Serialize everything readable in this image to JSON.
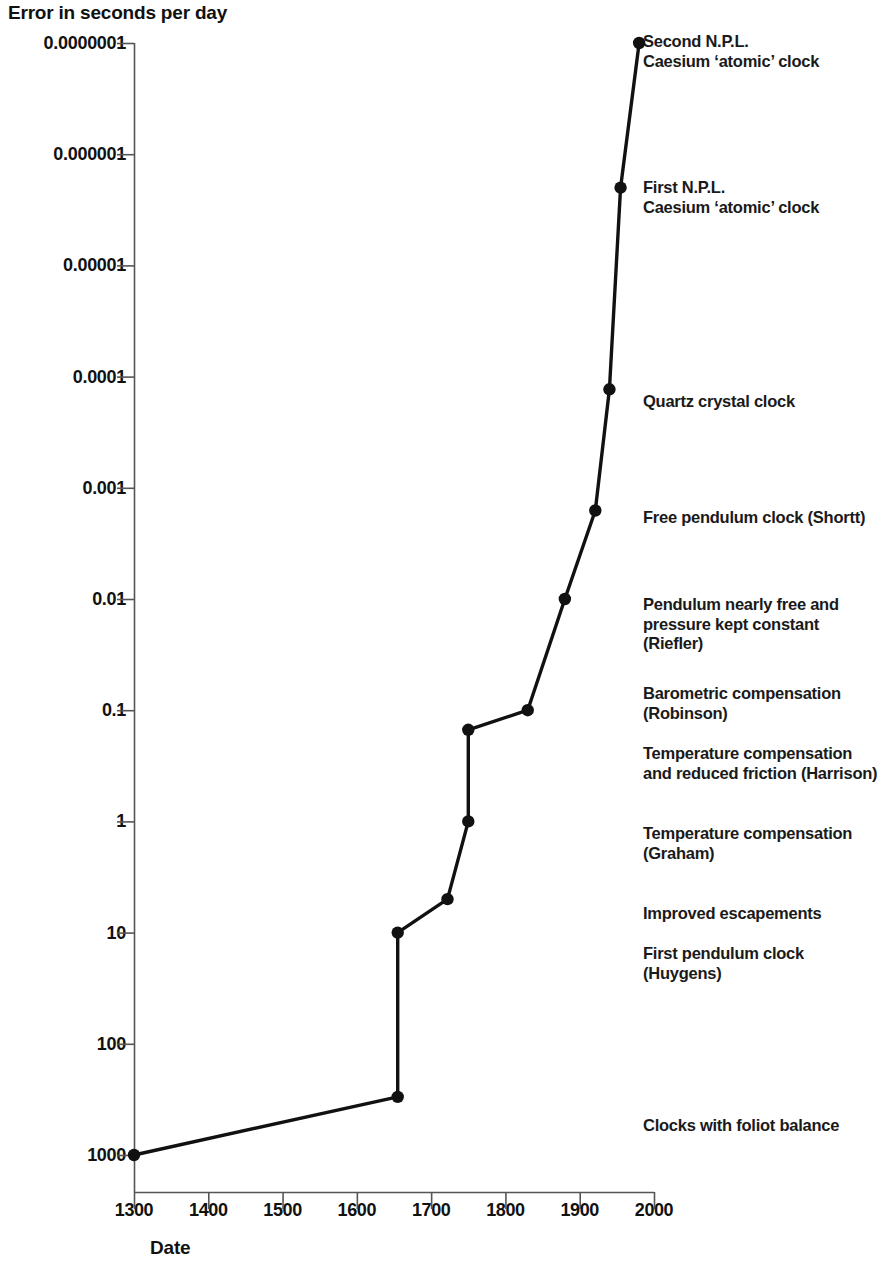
{
  "chart_data": {
    "type": "line",
    "title": "",
    "ylabel": "Error in seconds per day",
    "xlabel": "Date",
    "yscale": "log",
    "y_axis_inverted": true,
    "ylim": [
      1e-07,
      1000
    ],
    "xlim": [
      1300,
      2000
    ],
    "grid": false,
    "legend": "none",
    "y_ticks": [
      "0.0000001",
      "0.000001",
      "0.00001",
      "0.0001",
      "0.001",
      "0.01",
      "0.1",
      "1",
      "10",
      "100",
      "1000"
    ],
    "y_tick_values": [
      1e-07,
      1e-06,
      1e-05,
      0.0001,
      0.001,
      0.01,
      0.1,
      1,
      10,
      100,
      1000
    ],
    "x_ticks": [
      "1300",
      "1400",
      "1500",
      "1600",
      "1700",
      "1800",
      "1900",
      "2000"
    ],
    "x_tick_values": [
      1300,
      1400,
      1500,
      1600,
      1700,
      1800,
      1900,
      2000
    ],
    "x": [
      1300,
      1655,
      1655,
      1722,
      1750,
      1750,
      1830,
      1880,
      1921,
      1940,
      1955,
      1980
    ],
    "y": [
      1000,
      300,
      10,
      5,
      1,
      0.15,
      0.1,
      0.01,
      0.0016,
      0.00013,
      2e-06,
      1e-07
    ],
    "points": [
      {
        "date": 1300,
        "error": 1000,
        "label": "Clocks with foliot balance"
      },
      {
        "date": 1655,
        "error": 300,
        "label": ""
      },
      {
        "date": 1655,
        "error": 10,
        "label": "First pendulum clock (Huygens)"
      },
      {
        "date": 1722,
        "error": 5,
        "label": "Improved escapements"
      },
      {
        "date": 1750,
        "error": 1,
        "label": "Temperature compensation\n(Graham)"
      },
      {
        "date": 1750,
        "error": 0.15,
        "label": "Temperature compensation\nand reduced friction (Harrison)"
      },
      {
        "date": 1830,
        "error": 0.1,
        "label": "Barometric compensation\n(Robinson)"
      },
      {
        "date": 1880,
        "error": 0.01,
        "label": "Pendulum nearly free and\npressure kept constant (Riefler)"
      },
      {
        "date": 1921,
        "error": 0.0016,
        "label": "Free pendulum clock (Shortt)"
      },
      {
        "date": 1940,
        "error": 0.00013,
        "label": "Quartz crystal clock"
      },
      {
        "date": 1955,
        "error": 2e-06,
        "label": "First N.P.L.\nCaesium ‘atomic’ clock"
      },
      {
        "date": 1980,
        "error": 1e-07,
        "label": "Second N.P.L.\nCaesium ‘atomic’ clock"
      }
    ],
    "annotations": [
      {
        "text": "Second N.P.L.\nCaesium ‘atomic’ clock",
        "x": 643,
        "y": 32
      },
      {
        "text": "First N.P.L.\nCaesium ‘atomic’ clock",
        "x": 643,
        "y": 178
      },
      {
        "text": "Quartz crystal clock",
        "x": 643,
        "y": 392
      },
      {
        "text": "Free pendulum clock (Shortt)",
        "x": 643,
        "y": 508
      },
      {
        "text": "Pendulum nearly free and\npressure kept constant (Riefler)",
        "x": 643,
        "y": 595
      },
      {
        "text": "Barometric compensation\n(Robinson)",
        "x": 643,
        "y": 684
      },
      {
        "text": "Temperature compensation\nand reduced friction (Harrison)",
        "x": 643,
        "y": 744
      },
      {
        "text": "Temperature compensation\n(Graham)",
        "x": 643,
        "y": 824
      },
      {
        "text": "Improved escapements",
        "x": 643,
        "y": 904
      },
      {
        "text": "First pendulum clock (Huygens)",
        "x": 643,
        "y": 944
      },
      {
        "text": "Clocks with foliot balance",
        "x": 643,
        "y": 1116
      }
    ],
    "colors": {
      "line": "#111111",
      "marker": "#111111",
      "axis": "#555555",
      "text": "#111111",
      "background": "#ffffff"
    }
  }
}
